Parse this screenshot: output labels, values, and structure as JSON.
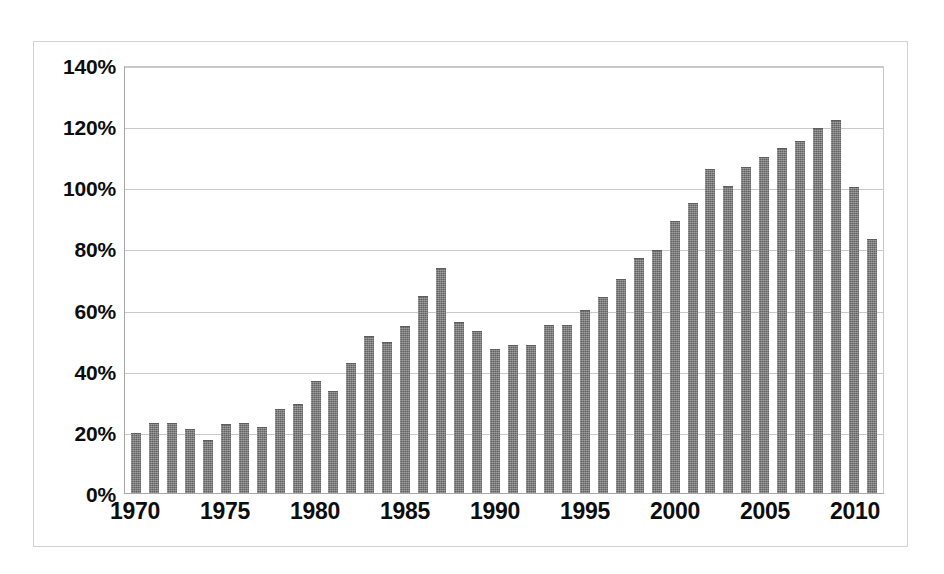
{
  "chart_data": {
    "type": "bar",
    "title": "",
    "subtitle": "",
    "xlabel": "",
    "ylabel": "",
    "ylim": [
      0,
      140
    ],
    "ytick_values": [
      0,
      20,
      40,
      60,
      80,
      100,
      120,
      140
    ],
    "ytick_labels": [
      "0%",
      "20%",
      "40%",
      "60%",
      "80%",
      "100%",
      "120%",
      "140%"
    ],
    "xtick_labels": [
      "1970",
      "1975",
      "1980",
      "1985",
      "1990",
      "1995",
      "2000",
      "2005",
      "2010"
    ],
    "xtick_values": [
      1970,
      1975,
      1980,
      1985,
      1990,
      1995,
      2000,
      2005,
      2010
    ],
    "grid": true,
    "legend": "none",
    "value_unit": "percent",
    "bar_color": "#6f6f6f",
    "categories": [
      "1970",
      "1971",
      "1972",
      "1973",
      "1974",
      "1975",
      "1976",
      "1977",
      "1978",
      "1979",
      "1980",
      "1981",
      "1982",
      "1983",
      "1984",
      "1985",
      "1986",
      "1987",
      "1988",
      "1989",
      "1990",
      "1991",
      "1992",
      "1993",
      "1994",
      "1995",
      "1996",
      "1997",
      "1998",
      "1999",
      "2000",
      "2001",
      "2002",
      "2003",
      "2004",
      "2005",
      "2006",
      "2007",
      "2008",
      "2009",
      "2010",
      "2011"
    ],
    "values": [
      19.5,
      23.0,
      23.0,
      21.0,
      17.5,
      22.5,
      23.0,
      21.5,
      27.5,
      29.0,
      36.5,
      33.5,
      42.5,
      51.5,
      49.5,
      54.5,
      64.5,
      73.5,
      56.0,
      53.0,
      47.0,
      48.5,
      48.5,
      55.0,
      55.0,
      60.0,
      64.0,
      70.0,
      77.0,
      79.5,
      89.0,
      95.0,
      106.0,
      100.5,
      106.5,
      110.0,
      113.0,
      115.0,
      119.5,
      122.0,
      100.0,
      83.0
    ]
  }
}
